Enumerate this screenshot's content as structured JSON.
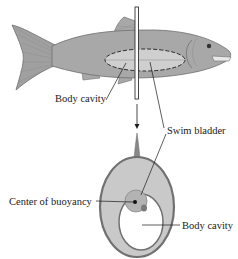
{
  "diagram": {
    "labels": {
      "body_cavity_top": "Body cavity",
      "swim_bladder": "Swim bladder",
      "center_of_buoyancy": "Center of buoyancy",
      "body_cavity_bottom": "Body cavity"
    },
    "colors": {
      "fish_body": "#a8a8a8",
      "fish_outline": "#6e6e6e",
      "bladder_fill": "#cfcfcf",
      "cross_section_fill": "#c9c9c9",
      "cavity_fill": "#ffffff",
      "bladder_circle": "#b3b3b3",
      "line": "#1a1a1a"
    }
  }
}
